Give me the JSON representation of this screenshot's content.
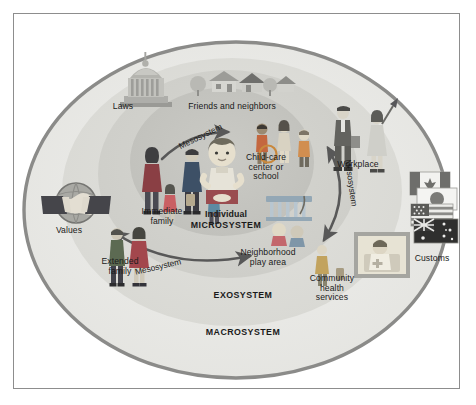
{
  "figure": {
    "background_color": "#ffffff",
    "border_color": "#8d8d8d"
  },
  "rings": [
    {
      "id": "macrosystem",
      "label": "MACROSYSTEM",
      "fill": "#e9e9e7",
      "stroke": "#8a8a88"
    },
    {
      "id": "exosystem",
      "label": "EXOSYSTEM",
      "fill": "#dededa",
      "stroke": "none"
    },
    {
      "id": "mesosystem",
      "label": "",
      "fill": "#d2d2cd",
      "stroke": "none"
    },
    {
      "id": "microsystem",
      "label": "MICROSYSTEM",
      "fill": "#c6c6c1",
      "stroke": "none"
    }
  ],
  "center": {
    "individual_label": "Individual",
    "system_label": "MICROSYSTEM"
  },
  "connectors": [
    {
      "id": "mesosystem-upper-left",
      "label": "Mesosystem",
      "style": "single-arrow",
      "direction": "up-right"
    },
    {
      "id": "mesosystem-lower-left",
      "label": "Mesosystem",
      "style": "double-arrow",
      "direction": "left-right"
    },
    {
      "id": "mesosystem-right",
      "label": "Mesosystem",
      "style": "double-arrow",
      "direction": "up-down"
    }
  ],
  "nodes": [
    {
      "id": "laws",
      "label": "Laws",
      "icon": "capitol-building-icon",
      "ring": "macrosystem"
    },
    {
      "id": "friends-neighbors",
      "label": "Friends and neighbors",
      "icon": "neighborhood-houses-icon",
      "ring": "exosystem"
    },
    {
      "id": "workplace",
      "label": "Workplace",
      "icon": "business-people-icon",
      "ring": "exosystem"
    },
    {
      "id": "customs",
      "label": "Customs",
      "icon": "world-flags-icon",
      "ring": "macrosystem"
    },
    {
      "id": "values",
      "label": "Values",
      "icon": "globe-handshake-icon",
      "ring": "macrosystem"
    },
    {
      "id": "child-care",
      "label": "Child-care\ncenter or\nschool",
      "icon": "children-group-icon",
      "ring": "microsystem"
    },
    {
      "id": "immediate-family",
      "label": "Immediate\nfamily",
      "icon": "family-group-icon",
      "ring": "microsystem"
    },
    {
      "id": "extended-family",
      "label": "Extended\nfamily",
      "icon": "couple-icon",
      "ring": "mesosystem"
    },
    {
      "id": "neighborhood-play",
      "label": "Neighborhood\nplay area",
      "icon": "playground-slide-icon",
      "ring": "microsystem"
    },
    {
      "id": "community-health",
      "label": "Community\nhealth\nservices",
      "icon": "nurse-patient-icon",
      "ring": "exosystem"
    }
  ],
  "flags": [
    "canada-flag",
    "japan-flag",
    "usa-flag",
    "australia-flag"
  ]
}
